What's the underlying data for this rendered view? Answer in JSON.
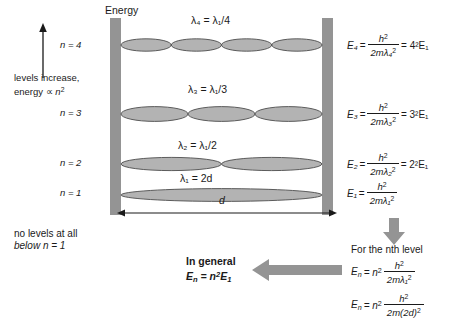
{
  "diagram": {
    "title_axis": "Energy",
    "annotations": {
      "levels_increase": "levels increase,",
      "energy_prop": "energy ∝ n",
      "energy_prop_exp": "2",
      "no_levels_line1": "no levels at all",
      "no_levels_line2": "below n = 1",
      "box_width_label": "d"
    },
    "levels": [
      {
        "n_label": "n = 4",
        "n_value": 4,
        "lobes": 4,
        "wavelength_label": "λ₄ = λ₁/4",
        "energy_lhs": "E₄",
        "energy_num": "h",
        "energy_num_exp": "2",
        "energy_den": "2mλ₄",
        "energy_den_exp": "2",
        "energy_rhs": "= 4²E₁"
      },
      {
        "n_label": "n = 3",
        "n_value": 3,
        "lobes": 3,
        "wavelength_label": "λ₃ = λ₁/3",
        "energy_lhs": "E₃",
        "energy_num": "h",
        "energy_num_exp": "2",
        "energy_den": "2mλ₃",
        "energy_den_exp": "2",
        "energy_rhs": "= 3²E₁"
      },
      {
        "n_label": "n = 2",
        "n_value": 2,
        "lobes": 2,
        "wavelength_label": "λ₂ = λ₁/2",
        "energy_lhs": "E₂",
        "energy_num": "h",
        "energy_num_exp": "2",
        "energy_den": "2mλ₂",
        "energy_den_exp": "2",
        "energy_rhs": "= 2²E₁"
      },
      {
        "n_label": "n = 1",
        "n_value": 1,
        "lobes": 1,
        "wavelength_label": "λ₁ = 2d",
        "energy_lhs": "E₁",
        "energy_num": "h",
        "energy_num_exp": "2",
        "energy_den": "2mλ₁",
        "energy_den_exp": "2",
        "energy_rhs": ""
      }
    ],
    "nth_level_panel": {
      "heading": "For the nth level",
      "eq1_lhs": "E",
      "eq1_lhs_sub": "n",
      "eq1_prefix": "= n",
      "eq1_prefix_exp": "2",
      "eq1_num": "h",
      "eq1_num_exp": "2",
      "eq1_den": "2mλ₁",
      "eq1_den_exp": "2",
      "eq2_lhs": "E",
      "eq2_lhs_sub": "n",
      "eq2_prefix": "= n",
      "eq2_prefix_exp": "2",
      "eq2_num": "h",
      "eq2_num_exp": "2",
      "eq2_den": "2m(2d)",
      "eq2_den_exp": "2"
    },
    "in_general_panel": {
      "heading": "In general",
      "formula_lhs": "E",
      "formula_lhs_sub": "n",
      "formula_rhs": "= n",
      "formula_rhs_exp": "2",
      "formula_tail": "E",
      "formula_tail_sub": "1"
    },
    "colors": {
      "wall": "#949494",
      "arrow_block": "#949494",
      "lobe_fill": "#b3b3b3",
      "lobe_stroke": "#4d4d4d",
      "text": "#1a1a1a"
    }
  }
}
